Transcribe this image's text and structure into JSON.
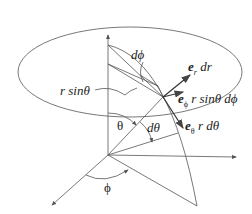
{
  "diagram": {
    "labels": {
      "dphi": "dϕ",
      "rsintheta": "r sinθ",
      "er_dr": {
        "vec": "e",
        "sub": "r",
        "rest": " dr"
      },
      "ephi": {
        "vec": "e",
        "sub": "ϕ",
        "rest": " r sinθ dϕ"
      },
      "etheta": {
        "vec": "e",
        "sub": "θ",
        "rest": " r dθ"
      },
      "theta": "θ",
      "dtheta": "dθ",
      "phi": "ϕ"
    },
    "colors": {
      "line": "#555555",
      "text": "#222222",
      "bg": "#ffffff"
    }
  }
}
